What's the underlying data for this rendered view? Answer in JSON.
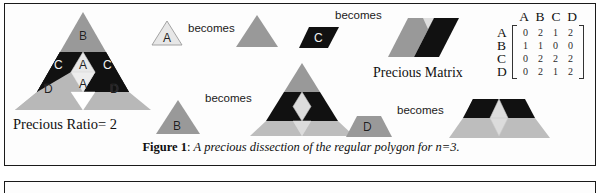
{
  "figure": {
    "caption_prefix": "Figure 1",
    "caption_sep": ": ",
    "caption_text": "A precious dissection of the regular polygon for n=3."
  },
  "labels": {
    "precious_ratio": "Precious Ratio= 2",
    "precious_matrix": "Precious Matrix",
    "becomes": "becomes"
  },
  "pieces": {
    "a": "A",
    "b": "B",
    "c": "C",
    "d": "D"
  },
  "main_triangle": {
    "top_label": "B",
    "mid_left_label": "C",
    "mid_right_label": "C",
    "mid_center_upper_label": "A",
    "mid_center_lower_label": "A",
    "bottom_left_label": "D",
    "bottom_right_label": "D"
  },
  "transforms": [
    {
      "id": "a-row",
      "source": "A",
      "verb": "becomes",
      "target": "gray-triangle"
    },
    {
      "id": "c-row",
      "source": "C",
      "verb": "becomes",
      "target": "two-band-parallelogram"
    },
    {
      "id": "b-row",
      "source": "B",
      "verb": "becomes",
      "target": "dissected-triangle"
    },
    {
      "id": "d-row",
      "source": "D",
      "verb": "becomes",
      "target": "dissected-trapezoid"
    }
  ],
  "matrix": {
    "title": "Precious Matrix",
    "col_headers": [
      "A",
      "B",
      "C",
      "D"
    ],
    "row_headers": [
      "A",
      "B",
      "C",
      "D"
    ],
    "rows": [
      [
        0,
        2,
        1,
        2
      ],
      [
        1,
        1,
        0,
        0
      ],
      [
        0,
        2,
        2,
        2
      ],
      [
        0,
        2,
        1,
        2
      ]
    ]
  },
  "colors": {
    "gray": "#999999",
    "light_gray": "#bdbdbd",
    "pale": "#e2e2e2",
    "black": "#111111",
    "page": "#ffffff",
    "border": "#1a1a1a"
  }
}
